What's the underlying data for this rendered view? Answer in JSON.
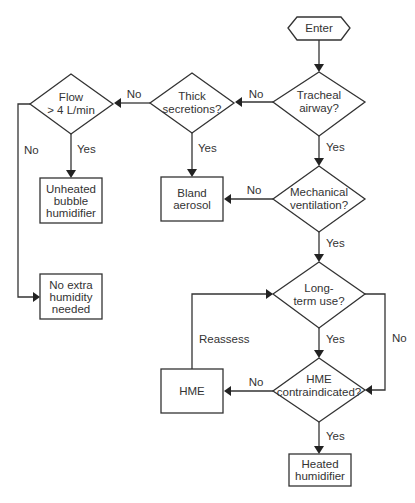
{
  "diagram": {
    "type": "flowchart",
    "topic": "Humidification device selection",
    "nodes": [
      {
        "id": "enter",
        "shape": "hexagon",
        "lines": [
          "Enter"
        ]
      },
      {
        "id": "tracheal",
        "shape": "diamond",
        "lines": [
          "Tracheal",
          "airway?"
        ]
      },
      {
        "id": "thick",
        "shape": "diamond",
        "lines": [
          "Thick",
          "secretions?"
        ]
      },
      {
        "id": "flow",
        "shape": "diamond",
        "lines": [
          "Flow",
          "> 4 L/min"
        ]
      },
      {
        "id": "unheated",
        "shape": "box",
        "lines": [
          "Unheated",
          "bubble",
          "humidifier"
        ]
      },
      {
        "id": "bland",
        "shape": "box",
        "lines": [
          "Bland",
          "aerosol"
        ]
      },
      {
        "id": "noextra",
        "shape": "box",
        "lines": [
          "No extra",
          "humidity",
          "needed"
        ]
      },
      {
        "id": "mechvent",
        "shape": "diamond",
        "lines": [
          "Mechanical",
          "ventilation?"
        ]
      },
      {
        "id": "longterm",
        "shape": "diamond",
        "lines": [
          "Long-",
          "term  use?"
        ]
      },
      {
        "id": "hmecontra",
        "shape": "diamond",
        "lines": [
          "HME",
          "contraindicated?"
        ]
      },
      {
        "id": "hme",
        "shape": "box",
        "lines": [
          "HME"
        ]
      },
      {
        "id": "heated",
        "shape": "box",
        "lines": [
          "Heated",
          "humidifier"
        ]
      }
    ],
    "edges": [
      {
        "from": "enter",
        "to": "tracheal",
        "label": ""
      },
      {
        "from": "tracheal",
        "to": "thick",
        "label": "No"
      },
      {
        "from": "tracheal",
        "to": "mechvent",
        "label": "Yes"
      },
      {
        "from": "thick",
        "to": "flow",
        "label": "No"
      },
      {
        "from": "thick",
        "to": "bland",
        "label": "Yes"
      },
      {
        "from": "flow",
        "to": "unheated",
        "label": "Yes"
      },
      {
        "from": "flow",
        "to": "noextra",
        "label": "No"
      },
      {
        "from": "mechvent",
        "to": "bland",
        "label": "No"
      },
      {
        "from": "mechvent",
        "to": "longterm",
        "label": "Yes"
      },
      {
        "from": "longterm",
        "to": "hmecontra",
        "label": "Yes"
      },
      {
        "from": "longterm",
        "to": "hmecontra",
        "label": "No"
      },
      {
        "from": "hmecontra",
        "to": "hme",
        "label": "No"
      },
      {
        "from": "hmecontra",
        "to": "heated",
        "label": "Yes"
      },
      {
        "from": "hme",
        "to": "longterm",
        "label": "Reassess"
      }
    ]
  },
  "labels": {
    "enter": "Enter",
    "tracheal_1": "Tracheal",
    "tracheal_2": "airway?",
    "thick_1": "Thick",
    "thick_2": "secretions?",
    "flow_1": "Flow",
    "flow_2": "> 4 L/min",
    "unheated_1": "Unheated",
    "unheated_2": "bubble",
    "unheated_3": "humidifier",
    "bland_1": "Bland",
    "bland_2": "aerosol",
    "noextra_1": "No extra",
    "noextra_2": "humidity",
    "noextra_3": "needed",
    "mechvent_1": "Mechanical",
    "mechvent_2": "ventilation?",
    "longterm_1": "Long-",
    "longterm_2": "term  use?",
    "hmecontra_1": "HME",
    "hmecontra_2": "contraindicated?",
    "hme": "HME",
    "heated_1": "Heated",
    "heated_2": "humidifier"
  },
  "edge_labels": {
    "tracheal_no": "No",
    "tracheal_yes": "Yes",
    "thick_no": "No",
    "thick_yes": "Yes",
    "flow_yes": "Yes",
    "flow_no": "No",
    "mechvent_no": "No",
    "mechvent_yes": "Yes",
    "longterm_yes": "Yes",
    "longterm_no": "No",
    "hmecontra_no": "No",
    "hmecontra_yes": "Yes",
    "reassess": "Reassess"
  },
  "colors": {
    "line": "#333333",
    "text": "#333333",
    "background": "#ffffff"
  }
}
